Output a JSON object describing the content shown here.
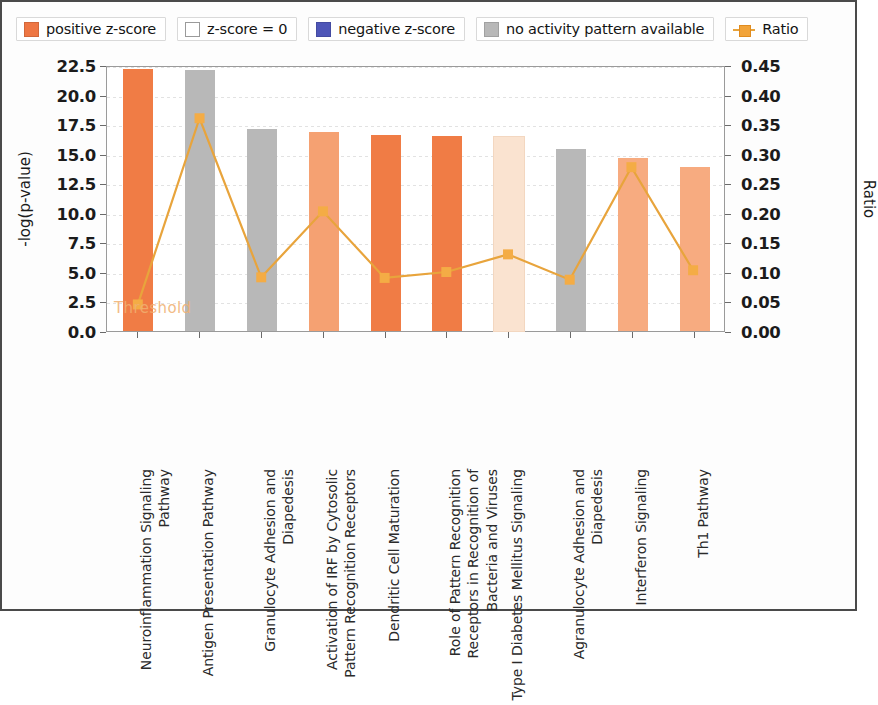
{
  "legend": {
    "items": [
      {
        "label": "positive z-score",
        "type": "swatch",
        "color": "#ee7643",
        "icon": "square-filled-icon"
      },
      {
        "label": "z-score = 0",
        "type": "swatch",
        "color": "#ffffff",
        "icon": "square-empty-icon"
      },
      {
        "label": "negative z-score",
        "type": "swatch",
        "color": "#4e56b8",
        "icon": "square-filled-icon"
      },
      {
        "label": "no activity pattern available",
        "type": "swatch",
        "color": "#b8b8b8",
        "icon": "square-filled-icon"
      },
      {
        "label": "Ratio",
        "type": "line",
        "color": "#f2a43a",
        "icon": "line-marker-icon"
      }
    ]
  },
  "threshold_label": "Threshold",
  "chart_data": {
    "type": "bar",
    "title": "",
    "xlabel": "",
    "ylabel": "-log(p-value)",
    "y2label": "Ratio",
    "ylim": [
      0.0,
      22.5
    ],
    "y2lim": [
      0.0,
      0.45
    ],
    "yticks": [
      "0.0",
      "2.5",
      "5.0",
      "7.5",
      "10.0",
      "12.5",
      "15.0",
      "17.5",
      "20.0",
      "22.5"
    ],
    "ytick_values": [
      0.0,
      2.5,
      5.0,
      7.5,
      10.0,
      12.5,
      15.0,
      17.5,
      20.0,
      22.5
    ],
    "y2ticks": [
      "0.00",
      "0.05",
      "0.10",
      "0.15",
      "0.20",
      "0.25",
      "0.30",
      "0.35",
      "0.40",
      "0.45"
    ],
    "y2tick_values": [
      0.0,
      0.05,
      0.1,
      0.15,
      0.2,
      0.25,
      0.3,
      0.35,
      0.4,
      0.45
    ],
    "grid": true,
    "legend_position": "top",
    "categories": [
      "Neuroinflammation Signaling Pathway",
      "Antigen Presentation Pathway",
      "Granulocyte Adhesion and Diapedesis",
      "Activation of IRF by Cytosolic Pattern Recognition Receptors",
      "Dendritic Cell Maturation",
      "Role of Pattern Recognition Receptors in Recognition of Bacteria and Viruses",
      "Type I Diabetes Mellitus Signaling",
      "Agranulocyte Adhesion and Diapedesis",
      "Interferon Signaling",
      "Th1 Pathway"
    ],
    "series": [
      {
        "name": "-log(p-value)",
        "axis": "left",
        "values": [
          22.2,
          22.1,
          17.1,
          16.8,
          16.6,
          16.5,
          16.4,
          15.4,
          14.6,
          13.9
        ],
        "bar_colors": [
          "#f07c45",
          "#b8b8b8",
          "#b8b8b8",
          "#f5a172",
          "#f07c45",
          "#f07c45",
          "#fae3d0",
          "#b8b8b8",
          "#f7ab80",
          "#f7ab80"
        ]
      },
      {
        "name": "Ratio",
        "axis": "right",
        "color": "#e8a43c",
        "values": [
          0.047,
          0.363,
          0.093,
          0.205,
          0.092,
          0.102,
          0.132,
          0.089,
          0.28,
          0.105
        ]
      }
    ]
  }
}
